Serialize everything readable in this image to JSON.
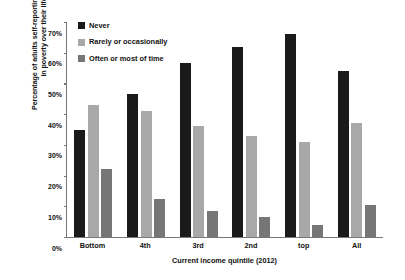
{
  "chart_data": {
    "type": "bar",
    "title": "",
    "xlabel": "Current income quintile (2012)",
    "ylabel": "Percentage of adults self-reporting as being in poverty over their life",
    "ylabel_lines": [
      "Percentage of adults self-reporting as being",
      "in poverty over their life"
    ],
    "categories": [
      "Bottom",
      "4th",
      "3rd",
      "2nd",
      "top",
      "All"
    ],
    "series": [
      {
        "name": "Never",
        "color": "#1a1a1a",
        "values": [
          35.0,
          46.5,
          56.5,
          62.0,
          66.0,
          54.0
        ]
      },
      {
        "name": "Rarely or occasionally",
        "color": "#a8a8a8",
        "values": [
          43.0,
          41.0,
          36.0,
          33.0,
          31.0,
          37.0
        ]
      },
      {
        "name": "Often or most of time",
        "color": "#767676",
        "values": [
          22.0,
          12.5,
          8.5,
          6.5,
          4.0,
          10.5
        ]
      }
    ],
    "ylim": [
      0,
      70
    ],
    "yticks": [
      "0%",
      "10%",
      "20%",
      "30%",
      "40%",
      "50%",
      "60%",
      "70%"
    ],
    "ytick_values": [
      0,
      10,
      20,
      30,
      40,
      50,
      60,
      70
    ],
    "grid": false,
    "legend_position": "top-left"
  }
}
